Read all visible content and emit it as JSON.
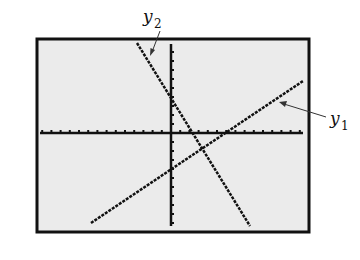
{
  "figure": {
    "screen": {
      "background": "#ebebeb",
      "border": "#111111"
    },
    "axes": {
      "color": "#111111",
      "x_ticks_left": 14,
      "x_ticks_right": 14,
      "y_ticks_up": 10,
      "y_ticks_down": 10
    },
    "lines": [
      {
        "name": "y1",
        "label_main": "y",
        "label_sub": "1",
        "slope_sign": "positive",
        "color": "#111111"
      },
      {
        "name": "y2",
        "label_main": "y",
        "label_sub": "2",
        "slope_sign": "negative",
        "color": "#111111"
      }
    ],
    "labels": {
      "y1": {
        "main": "y",
        "sub": "1"
      },
      "y2": {
        "main": "y",
        "sub": "2"
      }
    },
    "intersection": "lines intersect in quadrant IV, just below the x-axis"
  }
}
